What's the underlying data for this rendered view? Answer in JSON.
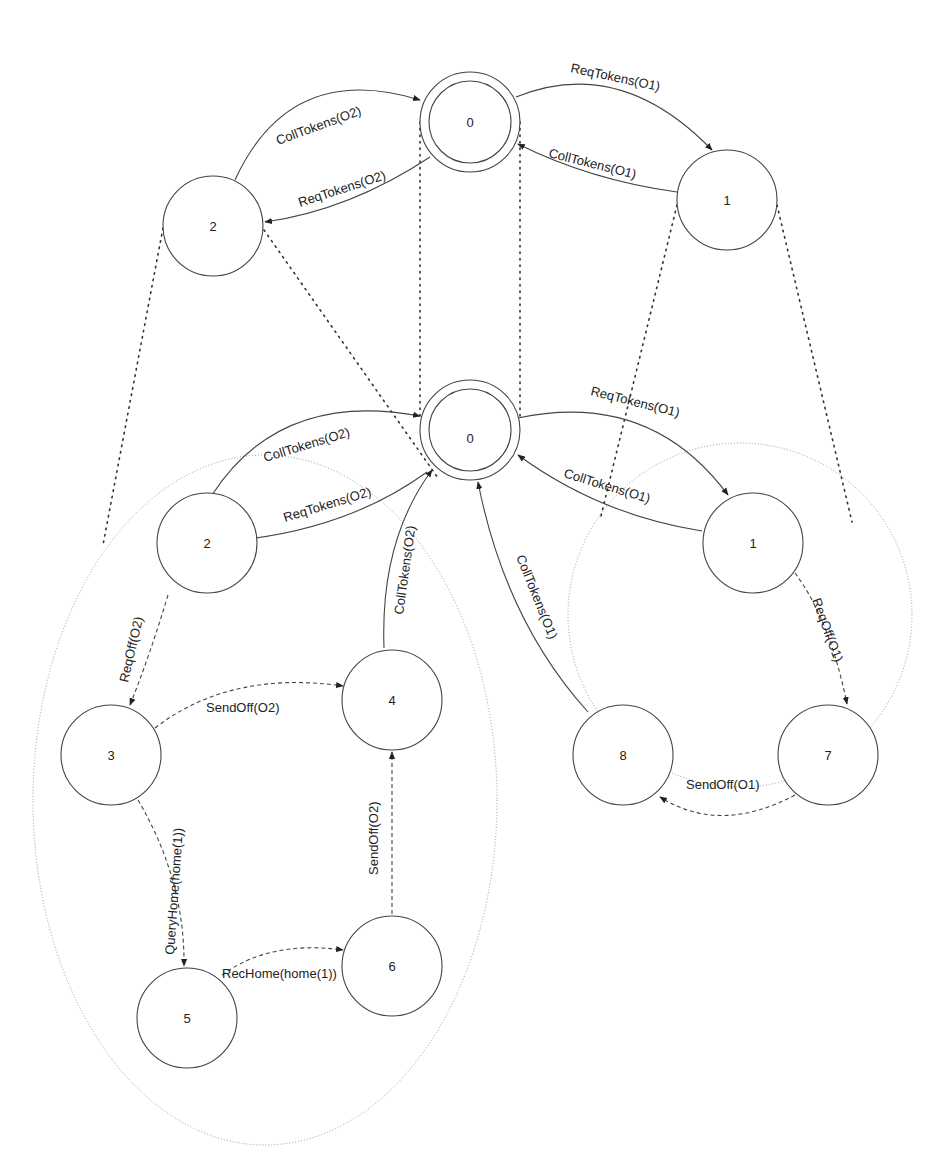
{
  "diagram": {
    "type": "state-machine-refinement",
    "top_machine": {
      "nodes": [
        {
          "id": "0",
          "label": "0",
          "initial": true
        },
        {
          "id": "1",
          "label": "1"
        },
        {
          "id": "2",
          "label": "2"
        }
      ],
      "edges": [
        {
          "from": "0",
          "to": "1",
          "label": "ReqTokens(O1)"
        },
        {
          "from": "1",
          "to": "0",
          "label": "CollTokens(O1)"
        },
        {
          "from": "0",
          "to": "2",
          "label": "ReqTokens(O2)"
        },
        {
          "from": "2",
          "to": "0",
          "label": "CollTokens(O2)"
        }
      ]
    },
    "bottom_machine": {
      "nodes": [
        {
          "id": "0",
          "label": "0",
          "initial": true
        },
        {
          "id": "1",
          "label": "1"
        },
        {
          "id": "2",
          "label": "2"
        },
        {
          "id": "3",
          "label": "3"
        },
        {
          "id": "4",
          "label": "4"
        },
        {
          "id": "5",
          "label": "5"
        },
        {
          "id": "6",
          "label": "6"
        },
        {
          "id": "7",
          "label": "7"
        },
        {
          "id": "8",
          "label": "8"
        }
      ],
      "edges": [
        {
          "from": "0",
          "to": "1",
          "label": "ReqTokens(O1)",
          "style": "solid"
        },
        {
          "from": "1",
          "to": "0",
          "label": "CollTokens(O1)",
          "style": "solid"
        },
        {
          "from": "0",
          "to": "2",
          "label": "ReqTokens(O2)",
          "style": "solid"
        },
        {
          "from": "2",
          "to": "0",
          "label": "CollTokens(O2)",
          "style": "solid"
        },
        {
          "from": "2",
          "to": "3",
          "label": "ReqOff(O2)",
          "style": "dashed"
        },
        {
          "from": "3",
          "to": "4",
          "label": "SendOff(O2)",
          "style": "dashed"
        },
        {
          "from": "3",
          "to": "5",
          "label": "QueryHome(home(1))",
          "style": "dashed"
        },
        {
          "from": "5",
          "to": "6",
          "label": "RecHome(home(1))",
          "style": "dashed"
        },
        {
          "from": "6",
          "to": "4",
          "label": "SendOff(O2)",
          "style": "dashed"
        },
        {
          "from": "4",
          "to": "0",
          "label": "CollTokens(O2)",
          "style": "solid"
        },
        {
          "from": "1",
          "to": "7",
          "label": "ReqOff(O1)",
          "style": "dashed"
        },
        {
          "from": "7",
          "to": "8",
          "label": "SendOff(O1)",
          "style": "dashed"
        },
        {
          "from": "8",
          "to": "0",
          "label": "CollTokens(O1)",
          "style": "solid"
        }
      ]
    },
    "refinement_regions": [
      {
        "abstract_state": "2",
        "refined_states": [
          "2",
          "3",
          "4",
          "5",
          "6"
        ]
      },
      {
        "abstract_state": "1",
        "refined_states": [
          "1",
          "7",
          "8"
        ]
      },
      {
        "abstract_state": "0",
        "refined_states": [
          "0"
        ]
      }
    ]
  },
  "labels": {
    "top": {
      "n0": "0",
      "n1": "1",
      "n2": "2",
      "e_0_1": "ReqTokens(O1)",
      "e_1_0": "CollTokens(O1)",
      "e_0_2": "ReqTokens(O2)",
      "e_2_0": "CollTokens(O2)"
    },
    "bottom": {
      "n0": "0",
      "n1": "1",
      "n2": "2",
      "n3": "3",
      "n4": "4",
      "n5": "5",
      "n6": "6",
      "n7": "7",
      "n8": "8",
      "e_0_1": "ReqTokens(O1)",
      "e_1_0": "CollTokens(O1)",
      "e_0_2": "ReqTokens(O2)",
      "e_2_0": "CollTokens(O2)",
      "e_2_3": "ReqOff(O2)",
      "e_3_4": "SendOff(O2)",
      "e_3_5": "QueryHome(home(1))",
      "e_5_6": "RecHome(home(1))",
      "e_6_4": "SendOff(O2)",
      "e_4_0": "CollTokens(O2)",
      "e_1_7": "ReqOff(O1)",
      "e_7_8": "SendOff(O1)",
      "e_8_0": "CollTokens(O1)"
    }
  }
}
